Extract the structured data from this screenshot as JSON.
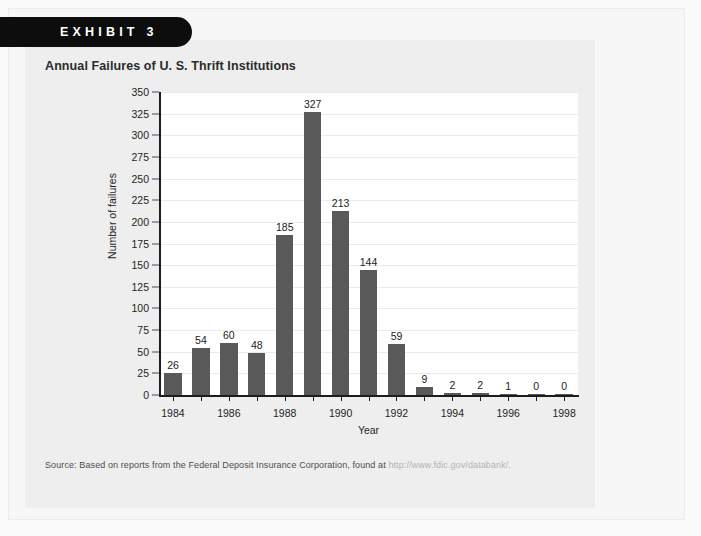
{
  "exhibit": {
    "banner_label": "EXHIBIT 3",
    "title": "Annual Failures of U. S. Thrift Institutions",
    "source_prefix": "Source: Based on reports from the Federal Deposit Insurance Corporation, found at ",
    "source_url": "http://www.fdic.gov/databank/."
  },
  "colors": {
    "banner_bg": "#0d0d0d",
    "bar_fill": "#595959",
    "panel_bg": "#eeeeee",
    "plot_bg": "#ffffff",
    "axis": "#1c1c1c",
    "gridline": "#eaeaea",
    "url_text": "#b3b3b3"
  },
  "chart_data": {
    "type": "bar",
    "title": "Annual Failures of U. S. Thrift Institutions",
    "xlabel": "Year",
    "ylabel": "Number of failures",
    "ylim": [
      0,
      350
    ],
    "ytick_step": 25,
    "yticks": [
      350,
      325,
      300,
      275,
      250,
      225,
      200,
      175,
      150,
      125,
      100,
      75,
      50,
      25,
      0
    ],
    "grid": true,
    "legend": "none",
    "categories": [
      1984,
      1985,
      1986,
      1987,
      1988,
      1989,
      1990,
      1991,
      1992,
      1993,
      1994,
      1995,
      1996,
      1997,
      1998
    ],
    "xtick_labels": [
      "1984",
      "",
      "1986",
      "",
      "1988",
      "",
      "1990",
      "",
      "1992",
      "",
      "1994",
      "",
      "1996",
      "",
      "1998"
    ],
    "values": [
      26,
      54,
      60,
      48,
      185,
      327,
      213,
      144,
      59,
      9,
      2,
      2,
      1,
      0,
      0
    ],
    "data_labels": [
      "26",
      "54",
      "60",
      "48",
      "185",
      "327",
      "213",
      "144",
      "59",
      "9",
      "2",
      "2",
      "1",
      "0",
      "0"
    ]
  }
}
